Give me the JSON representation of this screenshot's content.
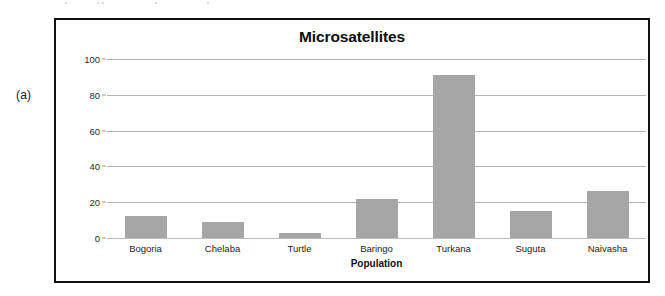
{
  "panel": {
    "label": "(a)"
  },
  "chart_data": {
    "type": "bar",
    "title": "Microsatellites",
    "xlabel": "Population",
    "ylabel": "No. of private alleles",
    "categories": [
      "Bogoria",
      "Chelaba",
      "Turtle",
      "Baringo",
      "Turkana",
      "Suguta",
      "Naivasha"
    ],
    "values": [
      12.5,
      9,
      3,
      22,
      91,
      15,
      26
    ],
    "ylim": [
      0,
      100
    ],
    "yticks": [
      0,
      20,
      40,
      60,
      80,
      100
    ],
    "ytick_labels": [
      "0",
      "20",
      "40",
      "60",
      "80",
      "100"
    ],
    "grid": true,
    "legend": false,
    "bar_color": "#a6a6a6",
    "gridline_color": "#b4b4b4",
    "frame_color": "#111111"
  }
}
